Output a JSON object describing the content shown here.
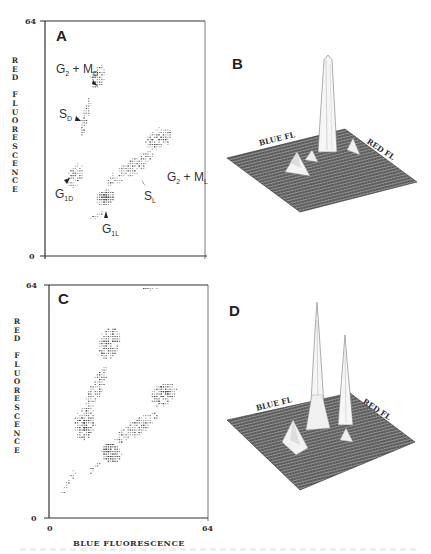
{
  "figure": {
    "panels": {
      "A": {
        "letter": "A",
        "type": "dot-plot",
        "y_axis": {
          "label": "RED FLUORESCENCE",
          "label_letters": [
            "R",
            "E",
            "D",
            "",
            "F",
            "L",
            "U",
            "O",
            "R",
            "E",
            "S",
            "C",
            "E",
            "N",
            "C",
            "E"
          ],
          "min": "0",
          "max": "64"
        },
        "annotations": [
          {
            "main": "G",
            "sub": "2",
            "rest": " + M",
            "sub2": "D"
          },
          {
            "main": "S",
            "sub": "D"
          },
          {
            "main": "G",
            "sub": "1D"
          },
          {
            "main": "G",
            "sub": "1L"
          },
          {
            "main": "S",
            "sub": "L"
          },
          {
            "main": "G",
            "sub": "2",
            "rest": " + M",
            "sub2": "L"
          }
        ]
      },
      "B": {
        "letter": "B",
        "type": "3d-surface",
        "axis_left": "BLUE FL",
        "axis_right": "RED FL"
      },
      "C": {
        "letter": "C",
        "type": "dot-plot",
        "y_axis": {
          "label": "RED FLUORESCENCE",
          "label_letters": [
            "R",
            "E",
            "D",
            "",
            "F",
            "L",
            "U",
            "O",
            "R",
            "E",
            "S",
            "C",
            "E",
            "N",
            "C",
            "E"
          ],
          "min": "0",
          "max": "64"
        },
        "x_axis": {
          "label": "BLUE FLUORESCENCE",
          "min": "0",
          "max": "64"
        }
      },
      "D": {
        "letter": "D",
        "type": "3d-surface",
        "axis_left": "BLUE FL",
        "axis_right": "RED FL"
      }
    }
  },
  "chart_data": [
    {
      "panel": "A",
      "type": "scatter",
      "title": "",
      "xlabel": "",
      "ylabel": "RED FLUORESCENCE",
      "xlim": [
        0,
        64
      ],
      "ylim": [
        0,
        64
      ],
      "grid": false,
      "populations": [
        {
          "name": "G1D",
          "x": 12,
          "y": 22
        },
        {
          "name": "SD",
          "x": 16,
          "y": 38
        },
        {
          "name": "G2+MD",
          "x": 21,
          "y": 49
        },
        {
          "name": "G1L",
          "x": 24,
          "y": 16
        },
        {
          "name": "SL",
          "x": 34,
          "y": 24
        },
        {
          "name": "G2+ML",
          "x": 45,
          "y": 32
        }
      ]
    },
    {
      "panel": "B",
      "type": "surface",
      "axes": [
        "BLUE FL",
        "RED FL"
      ],
      "peaks": [
        {
          "name": "G1L (dominant)",
          "relative_height": 1.0
        },
        {
          "name": "G1D",
          "relative_height": 0.2
        },
        {
          "name": "G2+ML",
          "relative_height": 0.15
        }
      ]
    },
    {
      "panel": "C",
      "type": "scatter",
      "xlabel": "BLUE FLUORESCENCE",
      "ylabel": "RED FLUORESCENCE",
      "xlim": [
        0,
        64
      ],
      "ylim": [
        0,
        64
      ],
      "grid": false,
      "populations": [
        {
          "name": "G1D",
          "x": 14,
          "y": 26
        },
        {
          "name": "G2+MD",
          "x": 24,
          "y": 48
        },
        {
          "name": "G1L",
          "x": 25,
          "y": 18
        },
        {
          "name": "G2+ML",
          "x": 46,
          "y": 34
        }
      ]
    },
    {
      "panel": "D",
      "type": "surface",
      "axes": [
        "BLUE FL",
        "RED FL"
      ],
      "peaks": [
        {
          "name": "G1L",
          "relative_height": 1.0
        },
        {
          "name": "G2+ML",
          "relative_height": 0.7
        },
        {
          "name": "G1D",
          "relative_height": 0.25
        }
      ]
    }
  ]
}
